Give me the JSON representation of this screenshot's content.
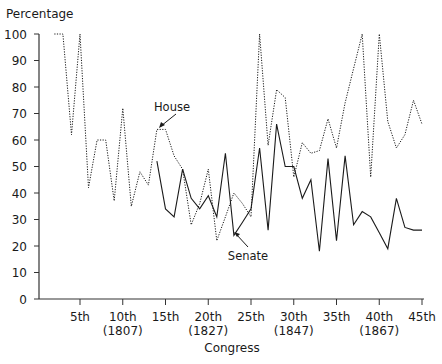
{
  "chart_data": {
    "type": "line",
    "title": "",
    "ylabel": "Percentage",
    "xlabel": "Congress",
    "ylim": [
      0,
      100
    ],
    "xlim": [
      1,
      45
    ],
    "grid": false,
    "yticks": [
      0,
      10,
      20,
      30,
      40,
      50,
      60,
      70,
      80,
      90,
      100
    ],
    "xticks": [
      {
        "value": 5,
        "label": "5th",
        "year": ""
      },
      {
        "value": 10,
        "label": "10th",
        "year": "(1807)"
      },
      {
        "value": 15,
        "label": "15th",
        "year": ""
      },
      {
        "value": 20,
        "label": "20th",
        "year": "(1827)"
      },
      {
        "value": 25,
        "label": "25th",
        "year": ""
      },
      {
        "value": 30,
        "label": "30th",
        "year": "(1847)"
      },
      {
        "value": 35,
        "label": "35th",
        "year": ""
      },
      {
        "value": 40,
        "label": "40th",
        "year": "(1867)"
      },
      {
        "value": 45,
        "label": "45th",
        "year": ""
      }
    ],
    "series": [
      {
        "name": "House",
        "style": "dotted",
        "x": [
          2,
          3,
          4,
          5,
          6,
          7,
          8,
          9,
          10,
          11,
          12,
          13,
          14,
          15,
          16,
          17,
          18,
          19,
          20,
          21,
          22,
          23,
          24,
          25,
          26,
          27,
          28,
          29,
          30,
          31,
          32,
          33,
          34,
          35,
          36,
          37,
          38,
          39,
          40,
          41,
          42,
          43,
          44,
          45
        ],
        "values": [
          100,
          100,
          62,
          100,
          42,
          60,
          60,
          37,
          72,
          35,
          48,
          43,
          64,
          64,
          54,
          49,
          28,
          36,
          49,
          22,
          31,
          40,
          36,
          31,
          100,
          58,
          79,
          76,
          46,
          59,
          55,
          56,
          68,
          57,
          74,
          87,
          100,
          46,
          100,
          67,
          57,
          62,
          75,
          66
        ]
      },
      {
        "name": "Senate",
        "style": "solid",
        "x": [
          14,
          15,
          16,
          17,
          18,
          19,
          20,
          21,
          22,
          23,
          24,
          25,
          26,
          27,
          28,
          29,
          30,
          31,
          32,
          33,
          34,
          35,
          36,
          37,
          38,
          39,
          40,
          41,
          42,
          43,
          44,
          45
        ],
        "values": [
          52,
          34,
          31,
          49,
          38,
          34,
          39,
          31,
          55,
          24,
          29,
          34,
          57,
          26,
          66,
          50,
          50,
          38,
          45,
          18,
          53,
          22,
          54,
          28,
          33,
          31,
          25,
          19,
          38,
          27,
          26,
          26
        ]
      }
    ],
    "annotations": [
      {
        "text": "House",
        "points_to_series": "House",
        "at_x": 14
      },
      {
        "text": "Senate",
        "points_to_series": "Senate",
        "at_x": 23
      }
    ]
  },
  "colors": {
    "line": "#1a1a1a",
    "axis": "#333333",
    "text": "#1a1a1a"
  }
}
